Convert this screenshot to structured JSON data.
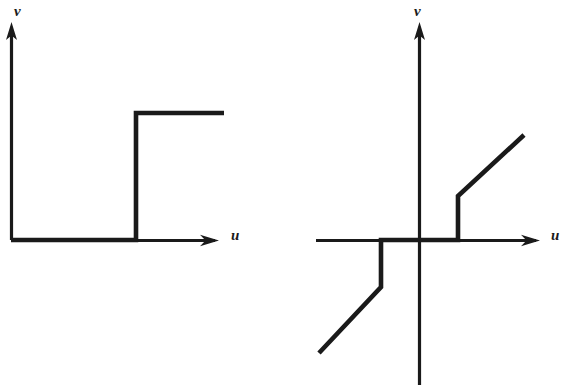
{
  "figure": {
    "background_color": "#ffffff",
    "ink_color": "#1a1a1a",
    "width": 572,
    "height": 385,
    "panel_count": 2
  },
  "panels": [
    {
      "id": "left",
      "name": "ideal-relay-with-dead-zone",
      "axes": {
        "x_label": "u",
        "y_label": "v",
        "x_axis": {
          "from_px": [
            11,
            240
          ],
          "to_px": [
            215,
            240
          ],
          "arrow": true
        },
        "y_axis": {
          "from_px": [
            11,
            240
          ],
          "to_px": [
            11,
            28
          ],
          "arrow": true
        },
        "origin_px": [
          11,
          240
        ]
      },
      "curve_points_px": [
        [
          11,
          240
        ],
        [
          136,
          240
        ],
        [
          136,
          113
        ],
        [
          224,
          113
        ]
      ]
    },
    {
      "id": "right",
      "name": "dead-zone-with-preload-and-linear-slope",
      "axes": {
        "x_label": "u",
        "y_label": "v",
        "x_axis": {
          "from_px": [
            30,
            240
          ],
          "to_px": [
            250,
            240
          ],
          "arrow": true
        },
        "y_axis": {
          "from_px": [
            133,
            385
          ],
          "to_px": [
            133,
            28
          ],
          "arrow": true
        },
        "origin_px": [
          133,
          240
        ]
      },
      "curve_points_px": [
        [
          33,
          353
        ],
        [
          95,
          287
        ],
        [
          95,
          240
        ],
        [
          172,
          240
        ],
        [
          172,
          196
        ],
        [
          238,
          135
        ]
      ]
    }
  ],
  "chart_data": {
    "type": "line",
    "title": "",
    "xlabel": "u",
    "ylabel": "v",
    "subplots": [
      {
        "name": "left",
        "description": "On-off (relay) nonlinearity: output stays at 0 until the input reaches a positive threshold, then jumps to a constant positive level and stays there.",
        "type": "line",
        "xlabel": "u",
        "ylabel": "v",
        "xlim": [
          0,
          10
        ],
        "ylim": [
          0,
          10
        ],
        "grid": false,
        "legend": "none",
        "series": [
          {
            "name": "v(u)",
            "x": [
              0.0,
              6.1,
              6.1,
              10.4
            ],
            "y": [
              0.0,
              0.0,
              6.0,
              6.0
            ]
          }
        ],
        "annotations": [
          {
            "text": "v",
            "position_px": [
              20,
              12
            ]
          },
          {
            "text": "u",
            "position_px": [
              238,
              232
            ]
          }
        ]
      },
      {
        "name": "right",
        "description": "Odd-symmetric dead-zone with preload: zero output inside the dead band, a jump to a preload level at the band edges, then a straight-line (linear gain) segment beyond.",
        "type": "line",
        "xlabel": "u",
        "ylabel": "v",
        "xlim": [
          -5,
          6
        ],
        "ylim": [
          -6,
          6
        ],
        "grid": false,
        "legend": "none",
        "series": [
          {
            "name": "v(u)",
            "x": [
              -4.9,
              -1.9,
              -1.9,
              1.9,
              1.9,
              5.2
            ],
            "y": [
              -5.4,
              -2.3,
              0.0,
              0.0,
              2.2,
              5.2
            ]
          }
        ],
        "annotations": [
          {
            "text": "v",
            "position_px": [
              414,
              12
            ]
          },
          {
            "text": "u",
            "position_px": [
              549,
              232
            ]
          }
        ]
      }
    ]
  },
  "labels": {
    "left_v": "v",
    "left_u": "u",
    "right_v": "v",
    "right_u": "u"
  }
}
